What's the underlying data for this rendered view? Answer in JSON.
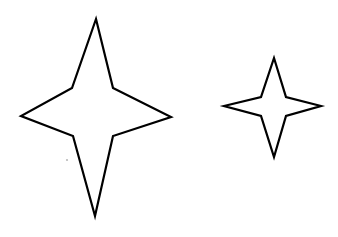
{
  "canvas": {
    "width": 338,
    "height": 237,
    "background_color": "#ffffff",
    "title": "Four-Pointed Stars"
  },
  "style": {
    "stroke_color": "#000000",
    "fill_color": "#ffffff",
    "stroke_width": 2.2,
    "speck_color": "#b9b9b9"
  },
  "shapes": [
    {
      "name": "large-four-pointed-star",
      "label": "Large four-pointed star",
      "points_count": 4,
      "center": {
        "x": 96,
        "y": 117
      },
      "outer_radius_x": 75,
      "outer_radius_y": 98,
      "inner_radius_x": 22,
      "inner_radius_y": 29,
      "bounding_box": {
        "x": 21,
        "y": 19,
        "width": 151,
        "height": 197
      },
      "tips": {
        "top": {
          "x": 96,
          "y": 19
        },
        "right": {
          "x": 171,
          "y": 117
        },
        "bottom": {
          "x": 95,
          "y": 216
        },
        "left": {
          "x": 21,
          "y": 116
        }
      },
      "polygon": "96,19 113,88 171,117 113,136 95,216 73,136 21,116 72,88"
    },
    {
      "name": "small-four-pointed-star",
      "label": "Small four-pointed star",
      "points_count": 4,
      "center": {
        "x": 273,
        "y": 107
      },
      "outer_radius_x": 49,
      "outer_radius_y": 49,
      "inner_radius_x": 13,
      "inner_radius_y": 10,
      "bounding_box": {
        "x": 224,
        "y": 58,
        "width": 97,
        "height": 99
      },
      "tips": {
        "top": {
          "x": 274,
          "y": 58
        },
        "right": {
          "x": 321,
          "y": 106
        },
        "bottom": {
          "x": 274,
          "y": 157
        },
        "left": {
          "x": 224,
          "y": 106
        }
      },
      "polygon": "274,58 286,97 321,106 286,116 274,157 261,116 224,106 261,97"
    }
  ],
  "artifacts": [
    {
      "name": "scan-speck",
      "label": "Faint gray scan speck",
      "x": 67,
      "y": 160,
      "radius": 1.1
    }
  ]
}
